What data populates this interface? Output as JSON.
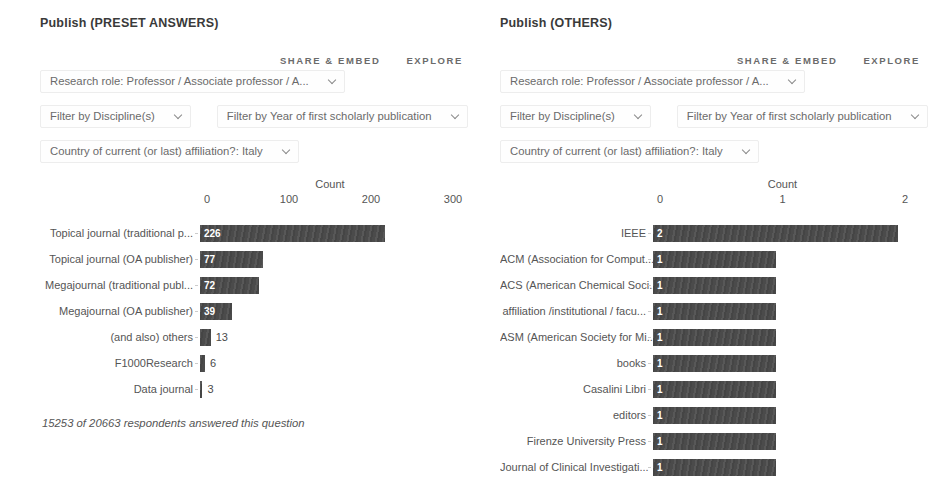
{
  "colors": {
    "bar": "#4b4b4b",
    "title_text": "#3a3a3a",
    "body_text": "#555555",
    "link_text": "#6b6b6b"
  },
  "panels": [
    {
      "title": "Publish (PRESET ANSWERS)",
      "actions": {
        "share_embed": "SHARE & EMBED",
        "explore": "EXPLORE"
      },
      "filters": {
        "research_role": "Research role: Professor / Associate professor / A...",
        "discipline": "Filter by Discipline(s)",
        "year": "Filter by Year of first scholarly publication",
        "country": "Country of current (or last) affiliation?: Italy"
      },
      "footnote": "15253 of 20663 respondents answered this question"
    },
    {
      "title": "Publish (OTHERS)",
      "actions": {
        "share_embed": "SHARE & EMBED",
        "explore": "EXPLORE"
      },
      "filters": {
        "research_role": "Research role: Professor / Associate professor / A...",
        "discipline": "Filter by Discipline(s)",
        "year": "Filter by Year of first scholarly publication",
        "country": "Country of current (or last) affiliation?: Italy"
      }
    }
  ],
  "chart_data": [
    {
      "type": "bar",
      "orientation": "horizontal",
      "axis_title": "Count",
      "categories": [
        "Topical journal (traditional p...",
        "Topical journal (OA publisher)",
        "Megajournal (traditional publ...",
        "Megajournal (OA publisher)",
        "(and also) others",
        "F1000Research",
        "Data journal"
      ],
      "values": [
        226,
        77,
        72,
        39,
        13,
        6,
        3
      ],
      "xlabel": "Count",
      "xlim": [
        0,
        300
      ],
      "xticks": [
        0,
        100,
        200,
        300
      ],
      "grid": false,
      "bar_color": "#4b4b4b"
    },
    {
      "type": "bar",
      "orientation": "horizontal",
      "axis_title": "Count",
      "categories": [
        "IEEE",
        "ACM (Association for Comput...",
        "ACS (American Chemical Soci...",
        "affiliation /institutional / facu...",
        "ASM (American Society for Mi...",
        "books",
        "Casalini Libri",
        "editors",
        "Firenze University Press",
        "Journal of Clinical Investigati..."
      ],
      "values": [
        2,
        1,
        1,
        1,
        1,
        1,
        1,
        1,
        1,
        1
      ],
      "xlabel": "Count",
      "xlim": [
        0,
        2
      ],
      "xticks": [
        0,
        1,
        2
      ],
      "grid": false,
      "bar_color": "#4b4b4b"
    }
  ]
}
